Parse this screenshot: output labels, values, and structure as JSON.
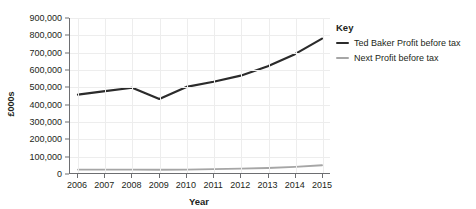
{
  "chart_data": {
    "type": "line",
    "title": "",
    "xlabel": "Year",
    "ylabel": "£000s",
    "categories": [
      "2006",
      "2007",
      "2008",
      "2009",
      "2010",
      "2011",
      "2012",
      "2013",
      "2014",
      "2015"
    ],
    "ylim": [
      0,
      900000
    ],
    "ytick_values": [
      0,
      100000,
      200000,
      300000,
      400000,
      500000,
      600000,
      700000,
      800000,
      900000
    ],
    "ytick_labels": [
      "0",
      "100,000",
      "200,000",
      "300,000",
      "400,000",
      "500,000",
      "600,000",
      "700,000",
      "800,000",
      "900,000"
    ],
    "grid": true,
    "legend_position": "right",
    "series": [
      {
        "name": "Ted Baker Profit before tax",
        "color": "#2b2b2b",
        "values": [
          455000,
          475000,
          495000,
          430000,
          500000,
          530000,
          565000,
          620000,
          690000,
          780000
        ]
      },
      {
        "name": "Next Profit before tax",
        "color": "#a6a6a6",
        "values": [
          20000,
          20000,
          20000,
          19000,
          20000,
          22000,
          25000,
          29000,
          36000,
          45000
        ]
      }
    ]
  },
  "legend": {
    "title": "Key"
  }
}
